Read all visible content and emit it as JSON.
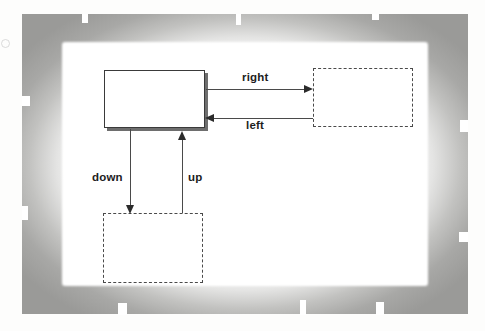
{
  "figure": {
    "kind": "state-transition-diagram",
    "reg_mark_icon": "circle-registration-mark",
    "current_state_box": {
      "name": "current-state",
      "style": "solid",
      "label": ""
    },
    "target_state_boxes": [
      {
        "name": "right-target-state",
        "style": "dashed",
        "label": ""
      },
      {
        "name": "down-target-state",
        "style": "dashed",
        "label": ""
      }
    ],
    "transitions": [
      {
        "id": "right",
        "label": "right",
        "direction": "right",
        "from": "current-state",
        "to": "right-target-state"
      },
      {
        "id": "left",
        "label": "left",
        "direction": "left",
        "from": "right-target-state",
        "to": "current-state"
      },
      {
        "id": "down",
        "label": "down",
        "direction": "down",
        "from": "current-state",
        "to": "down-target-state"
      },
      {
        "id": "up",
        "label": "up",
        "direction": "up",
        "from": "down-target-state",
        "to": "current-state"
      }
    ]
  },
  "colors": {
    "stroke": "#4a4a4a",
    "solid_border": "#3a3a3a",
    "shadow": "#6e6e6e",
    "text": "#1d1d1d",
    "frame": "#9a9a98",
    "page": "#ffffff"
  }
}
